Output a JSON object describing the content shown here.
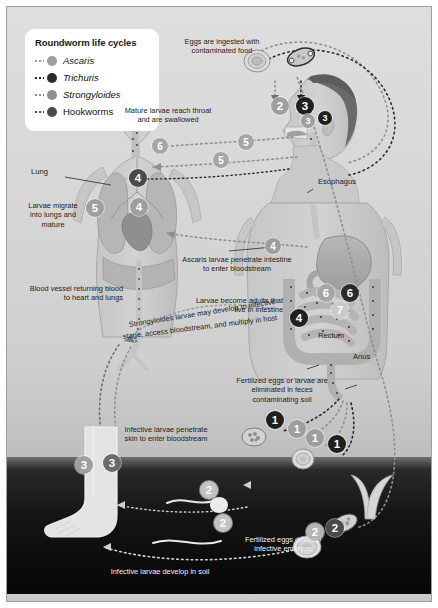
{
  "figure": {
    "width": 438,
    "height": 608
  },
  "legend": {
    "title": "Roundworm life cycles",
    "items": [
      {
        "label": "Ascaris",
        "italic": true,
        "color": "#9e9e9e"
      },
      {
        "label": "Trichuris",
        "italic": true,
        "color": "#2b2b2b"
      },
      {
        "label": "Strongyloides",
        "italic": true,
        "color": "#8f8f8f"
      },
      {
        "label": "Hookworms",
        "italic": false,
        "color": "#4a4a4a"
      }
    ]
  },
  "notes": {
    "eggs_ingested": "Eggs are ingested with contaminated food",
    "mature_larvae": "Mature larvae reach throat and are swallowed",
    "lung": "Lung",
    "larvae_migrate": "Larvae migrate into lungs and mature",
    "esophagus": "Esophagus",
    "blood_vessel": "Blood vessel returning blood to heart and lungs",
    "ascaris_penetrate": "Ascaris larvae penetrate intestine to enter bloodstream",
    "larvae_adults": "Larvae become adults that live in intestine",
    "rectum": "Rectum",
    "anus": "Anus",
    "strongyloides_curve_1": "Strongyloides larvae may develop to infective",
    "strongyloides_curve_2": "stage, access bloodstream, and multiply in host",
    "fertilized_eliminated": "Fertilized eggs or larvae are eliminated in feces contaminating soil",
    "infective_penetrate": "Infective larvae penetrate skin to enter bloodstream",
    "infective_develop_soil": "Infective larvae develop in soil",
    "fertilized_develop": "Fertilized eggs develop infective embryos"
  },
  "badges": [
    {
      "id": "b-2-food",
      "label": "2",
      "color": "#9e9e9e",
      "x": 270,
      "y": 96,
      "size": "lg"
    },
    {
      "id": "b-3-food",
      "label": "3",
      "color": "#1f1f1f",
      "x": 295,
      "y": 96,
      "size": "lg"
    },
    {
      "id": "b-3-throat",
      "label": "3",
      "color": "#9e9e9e",
      "x": 300,
      "y": 113,
      "size": "sm"
    },
    {
      "id": "b-3-throat-dark",
      "label": "3",
      "color": "#1f1f1f",
      "x": 317,
      "y": 110,
      "size": "sm"
    },
    {
      "id": "b-6-throat",
      "label": "6",
      "color": "#a6a6a6",
      "x": 151,
      "y": 137,
      "size": ""
    },
    {
      "id": "b-5-throat",
      "label": "5",
      "color": "#a6a6a6",
      "x": 237,
      "y": 133,
      "size": ""
    },
    {
      "id": "b-5-throat-2",
      "label": "5",
      "color": "#a6a6a6",
      "x": 212,
      "y": 151,
      "size": ""
    },
    {
      "id": "b-4-lung-r",
      "label": "4",
      "color": "#4a4a4a",
      "x": 128,
      "y": 168,
      "size": "lg"
    },
    {
      "id": "b-5-lung",
      "label": "5",
      "color": "#9e9e9e",
      "x": 85,
      "y": 198,
      "size": "lg"
    },
    {
      "id": "b-4-lung-l",
      "label": "4",
      "color": "#9e9e9e",
      "x": 129,
      "y": 197,
      "size": "lg"
    },
    {
      "id": "b-4-intestine",
      "label": "4",
      "color": "#9e9e9e",
      "x": 264,
      "y": 237,
      "size": ""
    },
    {
      "id": "b-6-int-1",
      "label": "6",
      "color": "#a6a6a6",
      "x": 316,
      "y": 283,
      "size": "lg"
    },
    {
      "id": "b-6-int-2",
      "label": "6",
      "color": "#2b2b2b",
      "x": 340,
      "y": 283,
      "size": "lg"
    },
    {
      "id": "b-7-int",
      "label": "7",
      "color": "#c9c9c9",
      "x": 330,
      "y": 300,
      "size": "lg"
    },
    {
      "id": "b-4-int-dark",
      "label": "4",
      "color": "#1f1f1f",
      "x": 289,
      "y": 308,
      "size": "lg"
    },
    {
      "id": "b-1-a",
      "label": "1",
      "color": "#1f1f1f",
      "x": 265,
      "y": 410,
      "size": "lg"
    },
    {
      "id": "b-1-b",
      "label": "1",
      "color": "#9e9e9e",
      "x": 287,
      "y": 419,
      "size": "lg"
    },
    {
      "id": "b-1-c",
      "label": "1",
      "color": "#9e9e9e",
      "x": 305,
      "y": 428,
      "size": "lg"
    },
    {
      "id": "b-1-d",
      "label": "1",
      "color": "#1f1f1f",
      "x": 327,
      "y": 434,
      "size": "lg"
    },
    {
      "id": "b-3-skin-1",
      "label": "3",
      "color": "#9e9e9e",
      "x": 74,
      "y": 455,
      "size": "lg"
    },
    {
      "id": "b-3-skin-2",
      "label": "3",
      "color": "#6b6b6b",
      "x": 102,
      "y": 453,
      "size": "lg"
    },
    {
      "id": "b-2-soil-1",
      "label": "2",
      "color": "#c2c2c2",
      "x": 199,
      "y": 480,
      "size": "lg"
    },
    {
      "id": "b-2-soil-2",
      "label": "2",
      "color": "#c2c2c2",
      "x": 213,
      "y": 513,
      "size": "lg"
    },
    {
      "id": "b-2-egg-1",
      "label": "2",
      "color": "#b5b5b5",
      "x": 305,
      "y": 522,
      "size": "lg"
    },
    {
      "id": "b-2-egg-2",
      "label": "2",
      "color": "#4a4a4a",
      "x": 325,
      "y": 518,
      "size": "lg"
    }
  ],
  "colors": {
    "background": "#d9d9d9",
    "soil": "#141414",
    "frame_border": "#9aa0a6",
    "text": "#1c1c1c",
    "text_on_soil": "#f2f2f2"
  }
}
